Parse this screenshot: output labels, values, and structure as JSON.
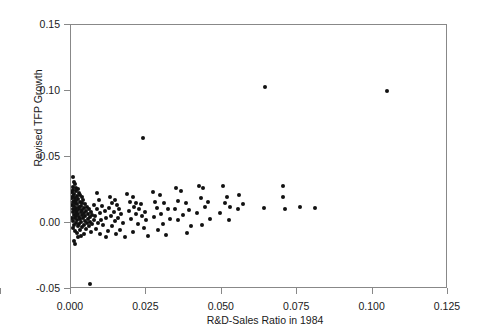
{
  "chart_data": {
    "type": "scatter",
    "title": "",
    "xlabel": "R&D-Sales Ratio in 1984",
    "ylabel": "Revised TFP Growth",
    "xlim": [
      0.0,
      0.125
    ],
    "ylim": [
      -0.05,
      0.15
    ],
    "xticks": [
      "0.000",
      "0.025",
      "0.050",
      "0.075",
      "0.100",
      "0.125"
    ],
    "xtick_values": [
      0.0,
      0.025,
      0.05,
      0.075,
      0.1,
      0.125
    ],
    "yticks": [
      "0.15",
      "0.10",
      "0.05",
      "0.00",
      "-0.05"
    ],
    "ytick_values": [
      0.15,
      0.1,
      0.05,
      0.0,
      -0.05
    ],
    "grid": false,
    "legend": null,
    "marker": {
      "shape": "circle",
      "color": "#111111",
      "size": 4
    },
    "n_points": 163,
    "points": [
      [
        0.0005,
        0.034
      ],
      [
        0.0009,
        0.03
      ],
      [
        0.0012,
        0.0285
      ],
      [
        0.0006,
        0.0262
      ],
      [
        0.0015,
        0.0255
      ],
      [
        0.0022,
        0.025
      ],
      [
        0.0008,
        0.024
      ],
      [
        0.0018,
        0.0232
      ],
      [
        0.0004,
        0.0225
      ],
      [
        0.0027,
        0.0218
      ],
      [
        0.0011,
        0.021
      ],
      [
        0.0031,
        0.0205
      ],
      [
        0.0007,
        0.0198
      ],
      [
        0.0019,
        0.0192
      ],
      [
        0.0036,
        0.0188
      ],
      [
        0.0003,
        0.0182
      ],
      [
        0.0014,
        0.0176
      ],
      [
        0.0024,
        0.017
      ],
      [
        0.0041,
        0.0166
      ],
      [
        0.0009,
        0.016
      ],
      [
        0.0017,
        0.0155
      ],
      [
        0.0029,
        0.015
      ],
      [
        0.0006,
        0.0146
      ],
      [
        0.0038,
        0.0142
      ],
      [
        0.0013,
        0.0138
      ],
      [
        0.0021,
        0.0133
      ],
      [
        0.0047,
        0.013
      ],
      [
        0.0002,
        0.0126
      ],
      [
        0.0033,
        0.0122
      ],
      [
        0.001,
        0.0118
      ],
      [
        0.0025,
        0.0114
      ],
      [
        0.0052,
        0.011
      ],
      [
        0.0016,
        0.0106
      ],
      [
        0.0043,
        0.0103
      ],
      [
        0.0005,
        0.0099
      ],
      [
        0.0028,
        0.0096
      ],
      [
        0.006,
        0.0092
      ],
      [
        0.0012,
        0.0089
      ],
      [
        0.0037,
        0.0086
      ],
      [
        0.002,
        0.0082
      ],
      [
        0.005,
        0.0079
      ],
      [
        0.0007,
        0.0076
      ],
      [
        0.0032,
        0.0072
      ],
      [
        0.0066,
        0.0069
      ],
      [
        0.0015,
        0.0066
      ],
      [
        0.0044,
        0.0062
      ],
      [
        0.0023,
        0.0059
      ],
      [
        0.0057,
        0.0056
      ],
      [
        0.0009,
        0.0052
      ],
      [
        0.0035,
        0.0049
      ],
      [
        0.0071,
        0.0046
      ],
      [
        0.0018,
        0.0043
      ],
      [
        0.0048,
        0.004
      ],
      [
        0.0027,
        0.0036
      ],
      [
        0.0062,
        0.0033
      ],
      [
        0.0004,
        0.003
      ],
      [
        0.004,
        0.0027
      ],
      [
        0.0013,
        0.0023
      ],
      [
        0.0055,
        0.002
      ],
      [
        0.003,
        0.0017
      ],
      [
        0.0075,
        0.0014
      ],
      [
        0.0021,
        0.001
      ],
      [
        0.0046,
        0.0006
      ],
      [
        0.0008,
        0.0003
      ],
      [
        0.0064,
        0.0
      ],
      [
        0.0034,
        -0.0004
      ],
      [
        0.0016,
        -0.0008
      ],
      [
        0.0052,
        -0.0012
      ],
      [
        0.0026,
        -0.0016
      ],
      [
        0.007,
        -0.002
      ],
      [
        0.0011,
        -0.0024
      ],
      [
        0.0042,
        -0.0028
      ],
      [
        0.0059,
        -0.0033
      ],
      [
        0.0022,
        -0.0038
      ],
      [
        0.0037,
        -0.0044
      ],
      [
        0.0006,
        -0.005
      ],
      [
        0.0049,
        -0.0056
      ],
      [
        0.0029,
        -0.0063
      ],
      [
        0.0014,
        -0.007
      ],
      [
        0.0066,
        -0.0078
      ],
      [
        0.0019,
        -0.0088
      ],
      [
        0.0044,
        -0.0096
      ],
      [
        0.0033,
        -0.0108
      ],
      [
        0.0023,
        -0.012
      ],
      [
        0.001,
        -0.015
      ],
      [
        0.0012,
        -0.0175
      ],
      [
        0.0062,
        -0.0478
      ],
      [
        0.0085,
        0.0218
      ],
      [
        0.0092,
        0.0162
      ],
      [
        0.0078,
        0.0128
      ],
      [
        0.0104,
        0.0118
      ],
      [
        0.0088,
        0.0096
      ],
      [
        0.0112,
        0.0084
      ],
      [
        0.0096,
        0.0062
      ],
      [
        0.0081,
        0.004
      ],
      [
        0.0118,
        0.003
      ],
      [
        0.01,
        0.0012
      ],
      [
        0.009,
        -0.001
      ],
      [
        0.0108,
        -0.003
      ],
      [
        0.0083,
        -0.0055
      ],
      [
        0.0122,
        -0.0072
      ],
      [
        0.0098,
        -0.0095
      ],
      [
        0.0115,
        -0.0122
      ],
      [
        0.0131,
        0.0188
      ],
      [
        0.0145,
        0.0165
      ],
      [
        0.0138,
        0.0138
      ],
      [
        0.0152,
        0.0125
      ],
      [
        0.0128,
        0.0104
      ],
      [
        0.016,
        0.0095
      ],
      [
        0.0142,
        0.0072
      ],
      [
        0.0168,
        0.006
      ],
      [
        0.0134,
        0.004
      ],
      [
        0.0155,
        0.0028
      ],
      [
        0.0148,
        0.0004
      ],
      [
        0.0172,
        -0.0012
      ],
      [
        0.0136,
        -0.0038
      ],
      [
        0.0163,
        -0.0062
      ],
      [
        0.015,
        -0.0092
      ],
      [
        0.018,
        -0.0118
      ],
      [
        0.024,
        0.064
      ],
      [
        0.0188,
        0.0212
      ],
      [
        0.0205,
        0.0185
      ],
      [
        0.0196,
        0.0152
      ],
      [
        0.0218,
        0.0142
      ],
      [
        0.0232,
        0.013
      ],
      [
        0.021,
        0.0112
      ],
      [
        0.0225,
        0.0096
      ],
      [
        0.0192,
        0.0082
      ],
      [
        0.0245,
        0.0075
      ],
      [
        0.0215,
        0.0058
      ],
      [
        0.0236,
        0.0042
      ],
      [
        0.02,
        0.0022
      ],
      [
        0.025,
        0.001
      ],
      [
        0.0222,
        -0.0016
      ],
      [
        0.0242,
        -0.005
      ],
      [
        0.0208,
        -0.0078
      ],
      [
        0.0258,
        -0.011
      ],
      [
        0.0272,
        0.0222
      ],
      [
        0.0295,
        0.0205
      ],
      [
        0.028,
        0.015
      ],
      [
        0.031,
        0.014
      ],
      [
        0.0288,
        0.0105
      ],
      [
        0.0322,
        0.0092
      ],
      [
        0.03,
        0.006
      ],
      [
        0.0276,
        0.0035
      ],
      [
        0.033,
        0.0018
      ],
      [
        0.0305,
        -0.002
      ],
      [
        0.029,
        -0.0065
      ],
      [
        0.0318,
        -0.0105
      ],
      [
        0.035,
        0.0255
      ],
      [
        0.0368,
        0.0236
      ],
      [
        0.0358,
        0.016
      ],
      [
        0.0382,
        0.0142
      ],
      [
        0.0345,
        0.0098
      ],
      [
        0.0392,
        0.0085
      ],
      [
        0.0372,
        0.0048
      ],
      [
        0.0355,
        0.001
      ],
      [
        0.04,
        -0.0035
      ],
      [
        0.0385,
        -0.009
      ],
      [
        0.0425,
        0.0268
      ],
      [
        0.044,
        0.0252
      ],
      [
        0.0432,
        0.0178
      ],
      [
        0.0455,
        0.015
      ],
      [
        0.0448,
        0.0108
      ],
      [
        0.042,
        0.0062
      ],
      [
        0.0462,
        0.002
      ],
      [
        0.0438,
        -0.003
      ],
      [
        0.0505,
        0.0272
      ],
      [
        0.052,
        0.019
      ],
      [
        0.0512,
        0.014
      ],
      [
        0.053,
        0.0108
      ],
      [
        0.0498,
        0.0062
      ],
      [
        0.0525,
        0.0015
      ],
      [
        0.056,
        0.02
      ],
      [
        0.0572,
        0.013
      ],
      [
        0.0555,
        0.0098
      ],
      [
        0.0648,
        0.1025
      ],
      [
        0.0642,
        0.0105
      ],
      [
        0.0705,
        0.0272
      ],
      [
        0.0708,
        0.0188
      ],
      [
        0.0712,
        0.0098
      ],
      [
        0.0762,
        0.0112
      ],
      [
        0.0812,
        0.01
      ],
      [
        0.1052,
        0.0995
      ]
    ]
  },
  "axis": {
    "ylabel_text": "Revised TFP Growth",
    "xlabel_text": "R&D-Sales Ratio in 1984"
  }
}
